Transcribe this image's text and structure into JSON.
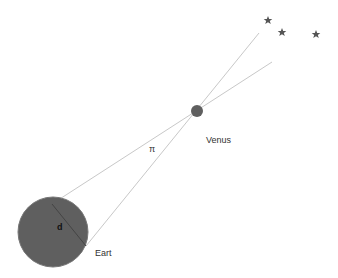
{
  "diagram": {
    "labels": {
      "venus": "Venus",
      "earth": "Eart",
      "distance": "d",
      "parallax": "π"
    },
    "colors": {
      "earth_fill": "#5f5f5f",
      "venus_fill": "#5f5f5f",
      "line": "#c8c8c8",
      "star": "#555555"
    },
    "stars": [
      {
        "x": 268,
        "y": 20
      },
      {
        "x": 282,
        "y": 32
      },
      {
        "x": 316,
        "y": 34
      }
    ]
  }
}
